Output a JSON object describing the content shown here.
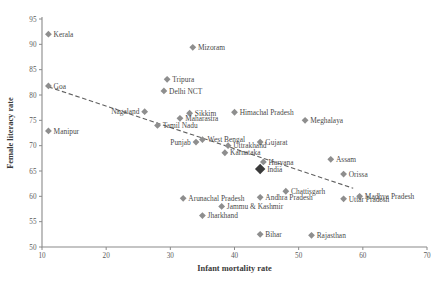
{
  "chart_data": {
    "type": "scatter",
    "title": "",
    "xlabel": "Infant mortality rate",
    "ylabel": "Female literacy rate",
    "xlim": [
      10,
      70
    ],
    "ylim": [
      50,
      95
    ],
    "xticks": [
      10,
      20,
      30,
      40,
      50,
      60,
      70
    ],
    "yticks": [
      50,
      55,
      60,
      65,
      70,
      75,
      80,
      85,
      90,
      95
    ],
    "grid": false,
    "legend": "none",
    "trendline": {
      "style": "dashed",
      "x": [
        11.0,
        58.5
      ],
      "y": [
        81.6,
        61.6
      ],
      "description": "Negative linear fit: female literacy declines as infant mortality rises"
    },
    "points": [
      {
        "label": "Kerala",
        "x": 11.0,
        "y": 92.0,
        "label_pos": "right",
        "highlight": false
      },
      {
        "label": "Goa",
        "x": 11.0,
        "y": 81.8,
        "label_pos": "right",
        "highlight": false
      },
      {
        "label": "Manipur",
        "x": 11.0,
        "y": 72.9,
        "label_pos": "right",
        "highlight": false
      },
      {
        "label": "Mizoram",
        "x": 33.5,
        "y": 89.4,
        "label_pos": "right",
        "highlight": false
      },
      {
        "label": "Tripura",
        "x": 29.5,
        "y": 83.1,
        "label_pos": "right",
        "highlight": false
      },
      {
        "label": "Delhi NCT",
        "x": 29.0,
        "y": 80.8,
        "label_pos": "right",
        "highlight": false
      },
      {
        "label": "Nagaland",
        "x": 26.0,
        "y": 76.7,
        "label_pos": "left",
        "highlight": false
      },
      {
        "label": "Sikkim",
        "x": 33.0,
        "y": 76.4,
        "label_pos": "right",
        "highlight": false
      },
      {
        "label": "Maharastra",
        "x": 31.5,
        "y": 75.4,
        "label_pos": "right",
        "highlight": false
      },
      {
        "label": "Tamil Nadu",
        "x": 28.0,
        "y": 74.0,
        "label_pos": "right",
        "highlight": false
      },
      {
        "label": "Himachal Pradesh",
        "x": 40.0,
        "y": 76.6,
        "label_pos": "right",
        "highlight": false
      },
      {
        "label": "Meghalaya",
        "x": 51.0,
        "y": 75.0,
        "label_pos": "right",
        "highlight": false
      },
      {
        "label": "West Bengal",
        "x": 35.0,
        "y": 71.2,
        "label_pos": "right",
        "highlight": false
      },
      {
        "label": "Punjab",
        "x": 34.0,
        "y": 70.7,
        "label_pos": "left",
        "highlight": false
      },
      {
        "label": "Gujarat",
        "x": 44.0,
        "y": 70.7,
        "label_pos": "right",
        "highlight": false
      },
      {
        "label": "Uttrakhand",
        "x": 39.0,
        "y": 70.0,
        "label_pos": "right",
        "highlight": false
      },
      {
        "label": "Karnataka",
        "x": 38.5,
        "y": 68.6,
        "label_pos": "right",
        "highlight": false
      },
      {
        "label": "Assam",
        "x": 55.0,
        "y": 67.3,
        "label_pos": "right",
        "highlight": false
      },
      {
        "label": "Haryana",
        "x": 44.5,
        "y": 66.8,
        "label_pos": "right",
        "highlight": false
      },
      {
        "label": "India",
        "x": 44.0,
        "y": 65.4,
        "label_pos": "right",
        "highlight": true
      },
      {
        "label": "Orissa",
        "x": 57.0,
        "y": 64.4,
        "label_pos": "right",
        "highlight": false
      },
      {
        "label": "Chattisgarh",
        "x": 48.0,
        "y": 61.0,
        "label_pos": "right",
        "highlight": false
      },
      {
        "label": "Madhya Pradesh",
        "x": 59.5,
        "y": 60.0,
        "label_pos": "right",
        "highlight": false
      },
      {
        "label": "Uttar Pradesh",
        "x": 57.0,
        "y": 59.5,
        "label_pos": "right",
        "highlight": false
      },
      {
        "label": "Andhra Pradesh",
        "x": 44.0,
        "y": 59.8,
        "label_pos": "right",
        "highlight": false
      },
      {
        "label": "Arunachal Pradesh",
        "x": 32.0,
        "y": 59.6,
        "label_pos": "right",
        "highlight": false
      },
      {
        "label": "Jammu & Kashmir",
        "x": 38.0,
        "y": 58.0,
        "label_pos": "right",
        "highlight": false
      },
      {
        "label": "Jharkhand",
        "x": 35.0,
        "y": 56.2,
        "label_pos": "right",
        "highlight": false
      },
      {
        "label": "Bihar",
        "x": 44.0,
        "y": 52.5,
        "label_pos": "right",
        "highlight": false
      },
      {
        "label": "Rajasthan",
        "x": 52.0,
        "y": 52.3,
        "label_pos": "right",
        "highlight": false
      }
    ]
  },
  "colors": {
    "marker": "#8e8e8e",
    "marker_highlight": "#3a3a3a",
    "axis": "#8a8a8a",
    "text": "#4a4a4a",
    "background": "#ffffff"
  }
}
